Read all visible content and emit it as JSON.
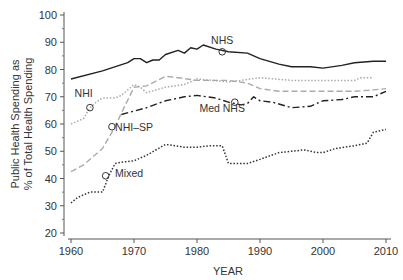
{
  "chart_data": {
    "type": "line",
    "title": "",
    "xlabel": "YEAR",
    "ylabel_line1": "Public Health Spending as",
    "ylabel_line2": "% of Total Health Spending",
    "xlim": [
      1960,
      2010
    ],
    "ylim": [
      20,
      100
    ],
    "x_ticks": [
      1960,
      1970,
      1980,
      1990,
      2000,
      2010
    ],
    "y_ticks": [
      20,
      30,
      40,
      50,
      60,
      70,
      80,
      90,
      100
    ],
    "grid": false,
    "legend": "inline labels",
    "series": [
      {
        "name": "NHS",
        "style": "solid",
        "color": "#222222",
        "x": [
          1960,
          1965,
          1969,
          1970,
          1971,
          1972,
          1973,
          1974,
          1975,
          1977,
          1978,
          1979,
          1980,
          1981,
          1983,
          1985,
          1988,
          1990,
          1993,
          1995,
          1998,
          2000,
          2003,
          2005,
          2008,
          2010
        ],
        "values": [
          76.5,
          79.5,
          82.5,
          84,
          84,
          82.5,
          83.5,
          83.5,
          85.5,
          87,
          86,
          88,
          87.5,
          89,
          87.5,
          86.5,
          86,
          84,
          82,
          81,
          81,
          80.5,
          81.5,
          82.5,
          83,
          83
        ],
        "marker": {
          "x": 1984,
          "y": 86.5
        },
        "label": {
          "text": "NHS",
          "x": 1984,
          "y": 89.5
        }
      },
      {
        "name": "NHI",
        "style": "dotted",
        "color": "#aaaaaa",
        "x": [
          1960,
          1962,
          1963,
          1964,
          1965,
          1967,
          1968,
          1970,
          1971,
          1972,
          1975,
          1978,
          1980,
          1985,
          1987,
          1990,
          1995,
          2000,
          2005,
          2006,
          2008
        ],
        "values": [
          60,
          62,
          66,
          68,
          69.5,
          69.5,
          70.5,
          74.5,
          73.5,
          71.5,
          73.5,
          74.5,
          76.5,
          75.5,
          76,
          77,
          76,
          76,
          76,
          77,
          77
        ],
        "marker": {
          "x": 1963,
          "y": 66
        },
        "label": {
          "text": "NHI",
          "x": 1962,
          "y": 70
        }
      },
      {
        "name": "NHI–SP",
        "style": "dashed",
        "color": "#aaaaaa",
        "x": [
          1960,
          1962,
          1965,
          1967,
          1968,
          1970,
          1972,
          1975,
          1977,
          1980,
          1985,
          1988,
          1990,
          1993,
          1995,
          2000,
          2005,
          2008,
          2010
        ],
        "values": [
          42.5,
          45,
          51,
          59,
          64,
          73.5,
          74,
          77.5,
          77,
          76,
          76,
          75,
          73,
          72,
          72,
          72,
          72,
          72.5,
          73
        ],
        "marker": {
          "x": 1966.5,
          "y": 59
        },
        "label": {
          "text": "NHI–SP",
          "x": 1967,
          "y": 57.5
        }
      },
      {
        "name": "Med NHS",
        "style": "dashdot",
        "color": "#222222",
        "x": [
          1968,
          1972,
          1975,
          1978,
          1980,
          1983,
          1985,
          1987,
          1988,
          1989,
          1990,
          1992,
          1995,
          1998,
          2000,
          2003,
          2005,
          2008,
          2010
        ],
        "values": [
          63.5,
          66,
          68.5,
          70,
          70.5,
          69.5,
          68,
          67,
          67.5,
          70,
          68.5,
          68,
          66,
          66.5,
          68.5,
          69,
          70,
          70,
          72
        ],
        "marker": {
          "x": 1986,
          "y": 68
        },
        "label": {
          "text": "Med NHS",
          "x": 1984,
          "y": 64.5
        }
      },
      {
        "name": "Mixed",
        "style": "dotted",
        "color": "#333333",
        "x": [
          1960,
          1961,
          1963,
          1965,
          1966,
          1967,
          1968,
          1970,
          1972,
          1975,
          1978,
          1980,
          1982,
          1984,
          1985,
          1988,
          1990,
          1993,
          1995,
          1997,
          1999,
          2000,
          2002,
          2005,
          2007,
          2008,
          2010
        ],
        "values": [
          31,
          33,
          35,
          35,
          41,
          45.5,
          46,
          46.5,
          48.5,
          52.5,
          51.5,
          51.5,
          52,
          52,
          45.5,
          45.5,
          47,
          49.5,
          50,
          50.5,
          49.5,
          49.5,
          51,
          52,
          53,
          57,
          58
        ],
        "marker": {
          "x": 1965.5,
          "y": 41
        },
        "label": {
          "text": "Mixed",
          "x": 1967,
          "y": 40.5
        }
      }
    ]
  }
}
